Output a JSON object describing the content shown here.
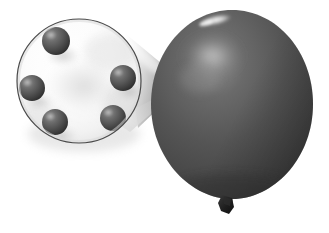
{
  "document": {
    "title": "Balloon with magnified surface detail",
    "background_color": "#ffffff",
    "width": 233,
    "height": 233,
    "type": "scientific-illustration"
  },
  "palette": {
    "page_background": "#ffffff",
    "balloon_base": "#4f4f4f",
    "balloon_dark_edge": "#3a3a3a",
    "balloon_mid": "#585858",
    "balloon_diffuse_highlight": "#b9b9b9",
    "balloon_specular_highlight": "#f2f2f2",
    "balloon_knot": "#1c1c1c",
    "cone_light": "#f4f4f4",
    "cone_mid": "#bdbdbd",
    "cone_dark": "#8c8c8c",
    "magnifier_fill": "#fbfbfb",
    "magnifier_stroke": "#4a4a4a",
    "magnifier_inner_shade": "#d8d8d8",
    "sphere_base": "#5a5a5a",
    "sphere_dark": "#2e2e2e",
    "sphere_highlight": "#9e9e9e",
    "sphere_shadow": "#c9c9c9"
  },
  "balloon": {
    "label": "Gray latex balloon",
    "center_x": 232,
    "center_y": 104,
    "radius_x": 81,
    "radius_y": 94,
    "top_y": 10,
    "bottom_y": 199,
    "left_x": 151,
    "right_x": 313,
    "specular": {
      "label": "Specular highlight streak",
      "center_x": 216,
      "center_y": 20,
      "radius_x": 16,
      "radius_y": 5,
      "rotation_deg": -12
    },
    "diffuse": {
      "label": "Diffuse highlight bloom",
      "center_x": 212,
      "center_y": 56,
      "radius_x": 32,
      "radius_y": 24
    },
    "knot": {
      "label": "Balloon knot",
      "x": 218,
      "y": 196,
      "width": 16,
      "height": 20
    },
    "neck": {
      "label": "Balloon neck",
      "x": 222,
      "y": 190,
      "width": 8,
      "height": 12
    }
  },
  "magnifier": {
    "label": "Magnified surface inset",
    "center_x": 79,
    "center_y": 81,
    "radius": 62,
    "stroke_width": 1.2,
    "inner_shade_label": "Soft inner vignette"
  },
  "cone": {
    "label": "Magnification connector cone",
    "apex_x": 185,
    "apex_y": 83,
    "base_top_x": 126,
    "base_top_y": 34,
    "base_bottom_x": 138,
    "base_bottom_y": 128
  },
  "spheres": {
    "label": "Surface particle spheres",
    "count": 5,
    "arrangement": "ring",
    "items": [
      {
        "name": "sphere-top",
        "cx": 56,
        "cy": 41,
        "r": 14
      },
      {
        "name": "sphere-left",
        "cx": 32,
        "cy": 88,
        "r": 13
      },
      {
        "name": "sphere-bottom-left",
        "cx": 55,
        "cy": 122,
        "r": 13
      },
      {
        "name": "sphere-bottom-right",
        "cx": 113,
        "cy": 118,
        "r": 13
      },
      {
        "name": "sphere-right",
        "cx": 123,
        "cy": 78,
        "r": 13
      }
    ]
  }
}
